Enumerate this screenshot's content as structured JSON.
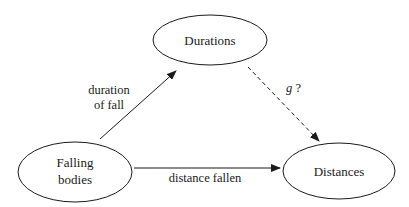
{
  "diagram": {
    "type": "concept-graph",
    "colors": {
      "stroke": "#1a1a1a",
      "background": "#ffffff",
      "text": "#1a1a1a"
    },
    "nodes": [
      {
        "id": "durations",
        "label": "Durations",
        "cx": 210,
        "cy": 40,
        "rx": 57,
        "ry": 25
      },
      {
        "id": "falling_bodies",
        "label_lines": [
          "Falling",
          "bodies"
        ],
        "cx": 75,
        "cy": 172,
        "rx": 57,
        "ry": 30
      },
      {
        "id": "distances",
        "label": "Distances",
        "cx": 339,
        "cy": 171,
        "rx": 56,
        "ry": 28
      }
    ],
    "edges": [
      {
        "id": "fb_to_dur",
        "from": "falling_bodies",
        "to": "durations",
        "style": "solid",
        "label_lines": [
          "duration",
          "of fall"
        ]
      },
      {
        "id": "fb_to_dist",
        "from": "falling_bodies",
        "to": "distances",
        "style": "solid",
        "label": "distance fallen"
      },
      {
        "id": "dur_to_dist",
        "from": "durations",
        "to": "distances",
        "style": "dashed",
        "label_var": "g",
        "label_suffix": " ?"
      }
    ]
  }
}
